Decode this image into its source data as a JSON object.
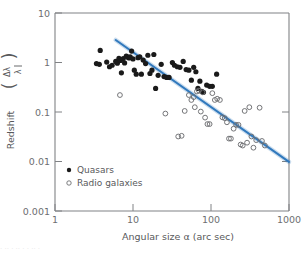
{
  "chart_data": {
    "type": "scatter",
    "title": "",
    "xlabel": "Angular size α  (arc sec)",
    "ylabel_main": "Redshift",
    "ylabel_numerator": "Δλ",
    "ylabel_denominator": "λ",
    "xscale": "log",
    "yscale": "log",
    "xlim": [
      1,
      1000
    ],
    "ylim": [
      0.001,
      10
    ],
    "xticks": [
      "1",
      "10",
      "100",
      "1000"
    ],
    "xtick_values": [
      1,
      10,
      100,
      1000
    ],
    "yticks": [
      "10",
      "1",
      "0.1",
      "0.01",
      "0.001"
    ],
    "ytick_values": [
      10,
      1,
      0.1,
      0.01,
      0.001
    ],
    "grid": false,
    "legend_position": "lower-left-inside",
    "series": [
      {
        "name": "Quasars",
        "marker": "filled-circle",
        "color": "#1a1a1a",
        "points": [
          [
            3.4,
            0.95
          ],
          [
            3.7,
            0.92
          ],
          [
            3.8,
            1.75
          ],
          [
            4.6,
            1.02
          ],
          [
            5.0,
            0.82
          ],
          [
            5.4,
            0.88
          ],
          [
            6.0,
            1.05
          ],
          [
            6.3,
            0.97
          ],
          [
            6.6,
            1.22
          ],
          [
            6.9,
            1.1
          ],
          [
            7.1,
            0.62
          ],
          [
            7.5,
            1.2
          ],
          [
            7.8,
            0.98
          ],
          [
            8.2,
            1.35
          ],
          [
            8.6,
            1.28
          ],
          [
            8.9,
            1.24
          ],
          [
            9.2,
            1.3
          ],
          [
            9.6,
            1.7
          ],
          [
            10.0,
            1.18
          ],
          [
            10.4,
            0.7
          ],
          [
            11.0,
            0.58
          ],
          [
            11.6,
            1.25
          ],
          [
            12.2,
            1.3
          ],
          [
            12.8,
            0.58
          ],
          [
            13.5,
            1.12
          ],
          [
            14.5,
            0.95
          ],
          [
            15.5,
            1.4
          ],
          [
            16.5,
            0.6
          ],
          [
            17.5,
            0.7
          ],
          [
            18.5,
            1.45
          ],
          [
            19.5,
            0.3
          ],
          [
            21.0,
            0.55
          ],
          [
            23.0,
            0.92
          ],
          [
            25.0,
            0.52
          ],
          [
            27.0,
            0.5
          ],
          [
            29.0,
            0.5
          ],
          [
            32.0,
            1.0
          ],
          [
            34.0,
            0.88
          ],
          [
            37.0,
            0.82
          ],
          [
            40.0,
            0.8
          ],
          [
            44.0,
            1.05
          ],
          [
            48.0,
            0.72
          ],
          [
            52.0,
            0.7
          ],
          [
            56.0,
            0.44
          ],
          [
            60.0,
            0.8
          ],
          [
            64.0,
            0.65
          ],
          [
            68.0,
            0.3
          ],
          [
            72.0,
            0.42
          ],
          [
            76.0,
            0.26
          ],
          [
            80.0,
            0.25
          ],
          [
            88.0,
            0.35
          ],
          [
            96.0,
            0.33
          ],
          [
            104.0,
            0.33
          ],
          [
            118.0,
            0.58
          ]
        ]
      },
      {
        "name": "Radio galaxies",
        "marker": "open-circle",
        "color": "#6d6e71",
        "points": [
          [
            6.8,
            0.22
          ],
          [
            26.0,
            0.093
          ],
          [
            38.0,
            0.032
          ],
          [
            42.0,
            0.033
          ],
          [
            46.0,
            0.105
          ],
          [
            52.0,
            0.22
          ],
          [
            56.0,
            0.175
          ],
          [
            60.0,
            0.2
          ],
          [
            62.0,
            0.125
          ],
          [
            66.0,
            0.26
          ],
          [
            70.0,
            0.27
          ],
          [
            74.0,
            0.102
          ],
          [
            78.0,
            0.25
          ],
          [
            84.0,
            0.077
          ],
          [
            90.0,
            0.057
          ],
          [
            96.0,
            0.057
          ],
          [
            104.0,
            0.24
          ],
          [
            112.0,
            0.175
          ],
          [
            120.0,
            0.185
          ],
          [
            130.0,
            0.175
          ],
          [
            140.0,
            0.078
          ],
          [
            150.0,
            0.075
          ],
          [
            160.0,
            0.062
          ],
          [
            170.0,
            0.029
          ],
          [
            180.0,
            0.029
          ],
          [
            195.0,
            0.046
          ],
          [
            210.0,
            0.055
          ],
          [
            225.0,
            0.055
          ],
          [
            240.0,
            0.022
          ],
          [
            255.0,
            0.021
          ],
          [
            270.0,
            0.105
          ],
          [
            290.0,
            0.024
          ],
          [
            310.0,
            0.125
          ],
          [
            330.0,
            0.032
          ],
          [
            350.0,
            0.019
          ],
          [
            380.0,
            0.027
          ],
          [
            420.0,
            0.122
          ],
          [
            450.0,
            0.026
          ],
          [
            490.0,
            0.021
          ]
        ]
      }
    ],
    "fit_line": {
      "name": "fit-line",
      "color": "#3179bd",
      "x_start": 6.0,
      "y_start": 2.85,
      "x_end": 1000.0,
      "y_end": 0.0098
    }
  },
  "legend": {
    "items": [
      {
        "label": "Quasars",
        "marker": "filled-circle"
      },
      {
        "label": "Radio galaxies",
        "marker": "open-circle"
      }
    ]
  },
  "caption": {
    "text": "· ·· · ·· · · ·· ·"
  },
  "colors": {
    "fit_line": "#3179bd",
    "quasar_marker": "#1a1a1a",
    "galaxy_marker": "#6d6e71",
    "axis": "#808285",
    "text": "#58595b",
    "background": "#ffffff"
  }
}
